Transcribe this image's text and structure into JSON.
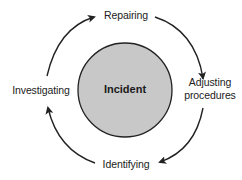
{
  "diagram": {
    "type": "cycle",
    "center": {
      "label": "Incident",
      "fill": "#c8c8c8",
      "stroke": "#222222"
    },
    "steps": [
      {
        "label": "Repairing"
      },
      {
        "label": "Adjusting procedures",
        "line1": "Adjusting",
        "line2": "procedures"
      },
      {
        "label": "Identifying"
      },
      {
        "label": "Investigating"
      }
    ],
    "arrow_color": "#222222",
    "direction": "clockwise"
  }
}
